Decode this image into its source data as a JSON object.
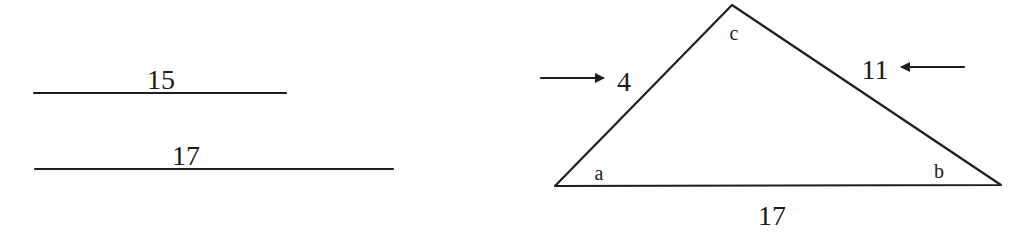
{
  "segments": [
    {
      "name": "segment-15",
      "label": "15",
      "x1": 34,
      "x2": 286,
      "y": 93,
      "label_x": 161,
      "label_y": 89
    },
    {
      "name": "segment-17",
      "label": "17",
      "x1": 35,
      "x2": 393,
      "y": 169,
      "label_x": 186,
      "label_y": 165
    }
  ],
  "triangle": {
    "vertices": {
      "a": {
        "label": "a",
        "x": 555,
        "y": 186,
        "label_x": 599,
        "label_y": 180
      },
      "b": {
        "label": "b",
        "x": 1001,
        "y": 185,
        "label_x": 939,
        "label_y": 178
      },
      "c": {
        "label": "c",
        "x": 732,
        "y": 5,
        "label_x": 734,
        "label_y": 40
      }
    },
    "sides": {
      "ac": {
        "label": "4",
        "label_x": 624,
        "label_y": 91
      },
      "bc": {
        "label": "11",
        "label_x": 875,
        "label_y": 79
      },
      "ab": {
        "label": "17",
        "label_x": 772,
        "label_y": 225
      }
    }
  },
  "arrows": [
    {
      "name": "arrow-right-pointing-to-4",
      "direction": "right",
      "x1": 541,
      "x2": 603,
      "y": 78
    },
    {
      "name": "arrow-left-pointing-to-11",
      "direction": "left",
      "x1": 964,
      "x2": 902,
      "y": 67
    }
  ],
  "colors": {
    "ink": "#1e1e1e",
    "background": "#ffffff"
  }
}
